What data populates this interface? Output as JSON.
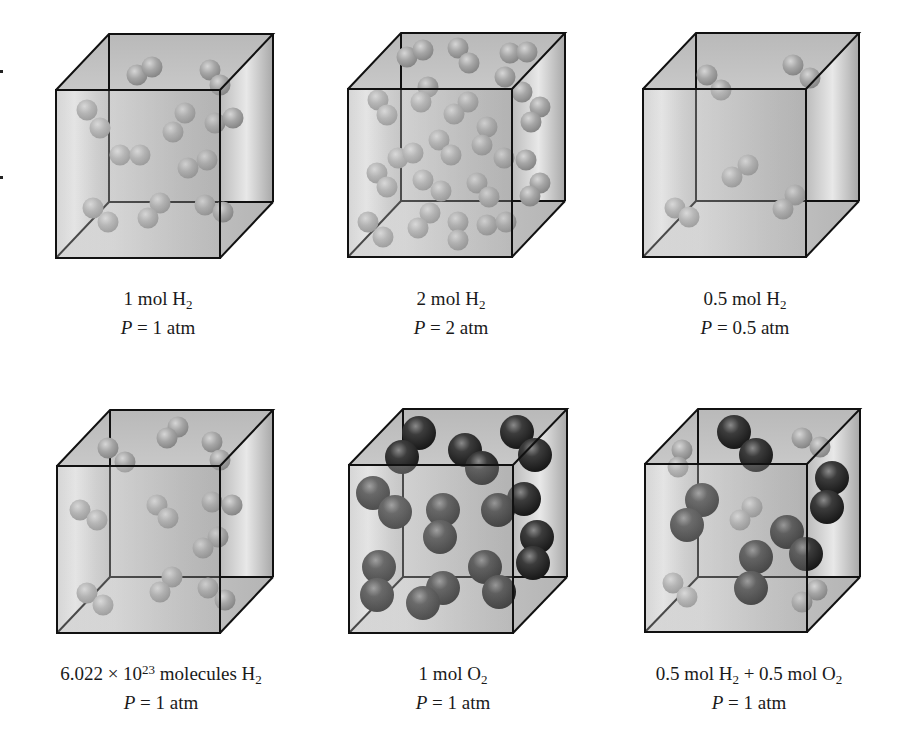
{
  "figure": {
    "colors": {
      "h2_molecule": "#a9a9a9",
      "o2_molecule": "#2e2e2e",
      "cube_edge": "#111111",
      "cube_face_light": "#e4e4e4",
      "cube_face_dark": "#b4b4b4"
    },
    "panels": [
      {
        "id": "p1",
        "label_parts": {
          "amount": "1 mol H",
          "sub": "2",
          "pressure_var": "P",
          "pressure_rest": " = 1 atm"
        },
        "cube": {
          "fx": 56,
          "fy": 90,
          "fw": 164,
          "fh": 168,
          "dx": 53,
          "dy": -56
        },
        "label_pos": {
          "cx": 158,
          "top": 282
        },
        "molecules": [
          {
            "t": "h",
            "p": [
              [
                137,
                75
              ],
              [
                152,
                67
              ]
            ]
          },
          {
            "t": "h",
            "p": [
              [
                210,
                70
              ],
              [
                220,
                85
              ]
            ]
          },
          {
            "t": "h",
            "p": [
              [
                87,
                110
              ],
              [
                100,
                128
              ]
            ]
          },
          {
            "t": "h",
            "p": [
              [
                185,
                113
              ],
              [
                173,
                132
              ]
            ]
          },
          {
            "t": "h",
            "p": [
              [
                215,
                123
              ],
              [
                233,
                118
              ]
            ]
          },
          {
            "t": "h",
            "p": [
              [
                120,
                155
              ],
              [
                140,
                155
              ]
            ]
          },
          {
            "t": "h",
            "p": [
              [
                207,
                160
              ],
              [
                188,
                168
              ]
            ]
          },
          {
            "t": "h",
            "p": [
              [
                93,
                208
              ],
              [
                108,
                222
              ]
            ]
          },
          {
            "t": "h",
            "p": [
              [
                160,
                203
              ],
              [
                148,
                218
              ]
            ]
          },
          {
            "t": "h",
            "p": [
              [
                205,
                205
              ],
              [
                223,
                212
              ]
            ]
          }
        ]
      },
      {
        "id": "p2",
        "label_parts": {
          "amount": "2 mol H",
          "sub": "2",
          "pressure_var": "P",
          "pressure_rest": " = 2 atm"
        },
        "cube": {
          "fx": 348,
          "fy": 89,
          "fw": 164,
          "fh": 168,
          "dx": 53,
          "dy": -56
        },
        "label_pos": {
          "cx": 451,
          "top": 282
        },
        "molecules": [
          {
            "t": "h",
            "p": [
              [
                407,
                57
              ],
              [
                423,
                50
              ]
            ]
          },
          {
            "t": "h",
            "p": [
              [
                458,
                48
              ],
              [
                469,
                63
              ]
            ]
          },
          {
            "t": "h",
            "p": [
              [
                510,
                53
              ],
              [
                527,
                52
              ]
            ]
          },
          {
            "t": "h",
            "p": [
              [
                505,
                77
              ],
              [
                522,
                92
              ]
            ]
          },
          {
            "t": "h",
            "p": [
              [
                428,
                87
              ],
              [
                421,
                102
              ]
            ]
          },
          {
            "t": "h",
            "p": [
              [
                378,
                100
              ],
              [
                387,
                115
              ]
            ]
          },
          {
            "t": "h",
            "p": [
              [
                468,
                102
              ],
              [
                454,
                114
              ]
            ]
          },
          {
            "t": "h",
            "p": [
              [
                540,
                107
              ],
              [
                531,
                122
              ]
            ]
          },
          {
            "t": "h",
            "p": [
              [
                487,
                127
              ],
              [
                482,
                145
              ]
            ]
          },
          {
            "t": "h",
            "p": [
              [
                439,
                140
              ],
              [
                451,
                155
              ]
            ]
          },
          {
            "t": "h",
            "p": [
              [
                398,
                158
              ],
              [
                413,
                153
              ]
            ]
          },
          {
            "t": "h",
            "p": [
              [
                504,
                158
              ],
              [
                526,
                160
              ]
            ]
          },
          {
            "t": "h",
            "p": [
              [
                377,
                173
              ],
              [
                387,
                187
              ]
            ]
          },
          {
            "t": "h",
            "p": [
              [
                423,
                180
              ],
              [
                441,
                191
              ]
            ]
          },
          {
            "t": "h",
            "p": [
              [
                477,
                183
              ],
              [
                489,
                197
              ]
            ]
          },
          {
            "t": "h",
            "p": [
              [
                540,
                183
              ],
              [
                530,
                196
              ]
            ]
          },
          {
            "t": "h",
            "p": [
              [
                368,
                222
              ],
              [
                383,
                237
              ]
            ]
          },
          {
            "t": "h",
            "p": [
              [
                430,
                213
              ],
              [
                418,
                228
              ]
            ]
          },
          {
            "t": "h",
            "p": [
              [
                458,
                222
              ],
              [
                458,
                240
              ]
            ]
          },
          {
            "t": "h",
            "p": [
              [
                487,
                225
              ],
              [
                506,
                222
              ]
            ]
          }
        ]
      },
      {
        "id": "p3",
        "label_parts": {
          "amount": "0.5 mol H",
          "sub": "2",
          "pressure_var": "P",
          "pressure_rest": " = 0.5 atm"
        },
        "cube": {
          "fx": 643,
          "fy": 89,
          "fw": 163,
          "fh": 168,
          "dx": 53,
          "dy": -56
        },
        "label_pos": {
          "cx": 745,
          "top": 282
        },
        "molecules": [
          {
            "t": "h",
            "p": [
              [
                707,
                75
              ],
              [
                721,
                90
              ]
            ]
          },
          {
            "t": "h",
            "p": [
              [
                793,
                65
              ],
              [
                810,
                78
              ]
            ]
          },
          {
            "t": "h",
            "p": [
              [
                748,
                165
              ],
              [
                732,
                177
              ]
            ]
          },
          {
            "t": "h",
            "p": [
              [
                675,
                208
              ],
              [
                689,
                217
              ]
            ]
          },
          {
            "t": "h",
            "p": [
              [
                795,
                195
              ],
              [
                783,
                209
              ]
            ]
          }
        ]
      },
      {
        "id": "p4",
        "label_parts": {
          "amount": "6.022 × 10",
          "sup": "23",
          "amount_rest": " molecules H",
          "sub": "2",
          "pressure_var": "P",
          "pressure_rest": " = 1 atm"
        },
        "cube": {
          "fx": 57,
          "fy": 466,
          "fw": 163,
          "fh": 167,
          "dx": 53,
          "dy": -56
        },
        "label_pos": {
          "cx": 161,
          "top": 657
        },
        "molecules": [
          {
            "t": "h",
            "p": [
              [
                108,
                448
              ],
              [
                125,
                462
              ]
            ]
          },
          {
            "t": "h",
            "p": [
              [
                178,
                427
              ],
              [
                167,
                438
              ]
            ]
          },
          {
            "t": "h",
            "p": [
              [
                212,
                442
              ],
              [
                220,
                460
              ]
            ]
          },
          {
            "t": "h",
            "p": [
              [
                80,
                510
              ],
              [
                97,
                520
              ]
            ]
          },
          {
            "t": "h",
            "p": [
              [
                157,
                505
              ],
              [
                168,
                518
              ]
            ]
          },
          {
            "t": "h",
            "p": [
              [
                212,
                502
              ],
              [
                232,
                505
              ]
            ]
          },
          {
            "t": "h",
            "p": [
              [
                218,
                537
              ],
              [
                203,
                548
              ]
            ]
          },
          {
            "t": "h",
            "p": [
              [
                87,
                593
              ],
              [
                103,
                605
              ]
            ]
          },
          {
            "t": "h",
            "p": [
              [
                172,
                577
              ],
              [
                160,
                592
              ]
            ]
          },
          {
            "t": "h",
            "p": [
              [
                208,
                588
              ],
              [
                225,
                600
              ]
            ]
          }
        ]
      },
      {
        "id": "p5",
        "label_parts": {
          "amount": "1 mol O",
          "sub": "2",
          "pressure_var": "P",
          "pressure_rest": " = 1 atm"
        },
        "cube": {
          "fx": 349,
          "fy": 465,
          "fw": 164,
          "fh": 168,
          "dx": 54,
          "dy": -56
        },
        "label_pos": {
          "cx": 453,
          "top": 657
        },
        "molecules": [
          {
            "t": "o",
            "p": [
              [
                419,
                433
              ],
              [
                402,
                457
              ]
            ]
          },
          {
            "t": "o",
            "p": [
              [
                465,
                450
              ],
              [
                482,
                468
              ]
            ]
          },
          {
            "t": "o",
            "p": [
              [
                517,
                432
              ],
              [
                535,
                455
              ]
            ]
          },
          {
            "t": "o",
            "p": [
              [
                373,
                493
              ],
              [
                395,
                512
              ]
            ]
          },
          {
            "t": "o",
            "p": [
              [
                443,
                510
              ],
              [
                440,
                537
              ]
            ]
          },
          {
            "t": "o",
            "p": [
              [
                524,
                499
              ],
              [
                498,
                510
              ]
            ]
          },
          {
            "t": "o",
            "p": [
              [
                537,
                537
              ],
              [
                533,
                563
              ]
            ]
          },
          {
            "t": "o",
            "p": [
              [
                379,
                567
              ],
              [
                377,
                595
              ]
            ]
          },
          {
            "t": "o",
            "p": [
              [
                485,
                567
              ],
              [
                499,
                592
              ]
            ]
          },
          {
            "t": "o",
            "p": [
              [
                443,
                588
              ],
              [
                423,
                603
              ]
            ]
          }
        ]
      },
      {
        "id": "p6",
        "label_parts": {
          "amount": "0.5 mol H",
          "sub": "2",
          "amount_rest": " + 0.5 mol O",
          "sub2": "2",
          "pressure_var": "P",
          "pressure_rest": " = 1 atm"
        },
        "cube": {
          "fx": 645,
          "fy": 464,
          "fw": 162,
          "fh": 168,
          "dx": 53,
          "dy": -55
        },
        "label_pos": {
          "cx": 749,
          "top": 657
        },
        "molecules": [
          {
            "t": "h",
            "p": [
              [
                682,
                450
              ],
              [
                678,
                467
              ]
            ]
          },
          {
            "t": "h",
            "p": [
              [
                802,
                438
              ],
              [
                820,
                447
              ]
            ]
          },
          {
            "t": "h",
            "p": [
              [
                752,
                507
              ],
              [
                740,
                520
              ]
            ]
          },
          {
            "t": "h",
            "p": [
              [
                673,
                583
              ],
              [
                687,
                597
              ]
            ]
          },
          {
            "t": "h",
            "p": [
              [
                817,
                590
              ],
              [
                802,
                602
              ]
            ]
          },
          {
            "t": "o",
            "p": [
              [
                734,
                432
              ],
              [
                756,
                455
              ]
            ]
          },
          {
            "t": "o",
            "p": [
              [
                832,
                478
              ],
              [
                827,
                507
              ]
            ]
          },
          {
            "t": "o",
            "p": [
              [
                702,
                500
              ],
              [
                687,
                525
              ]
            ]
          },
          {
            "t": "o",
            "p": [
              [
                787,
                532
              ],
              [
                806,
                554
              ]
            ]
          },
          {
            "t": "o",
            "p": [
              [
                756,
                557
              ],
              [
                751,
                588
              ]
            ]
          }
        ]
      }
    ]
  },
  "labels": {
    "p1": {
      "line1_a": "1 mol H",
      "line1_sub": "2",
      "line2_var": "P",
      "line2_rest": " = 1 atm"
    },
    "p2": {
      "line1_a": "2 mol H",
      "line1_sub": "2",
      "line2_var": "P",
      "line2_rest": " = 2 atm"
    },
    "p3": {
      "line1_a": "0.5 mol H",
      "line1_sub": "2",
      "line2_var": "P",
      "line2_rest": " = 0.5 atm"
    },
    "p4": {
      "line1_a": "6.022 × 10",
      "line1_sup": "23",
      "line1_b": " molecules H",
      "line1_sub": "2",
      "line2_var": "P",
      "line2_rest": " = 1 atm"
    },
    "p5": {
      "line1_a": "1 mol O",
      "line1_sub": "2",
      "line2_var": "P",
      "line2_rest": " = 1 atm"
    },
    "p6": {
      "line1_a": "0.5 mol H",
      "line1_sub": "2",
      "line1_b": " + 0.5 mol O",
      "line1_sub2": "2",
      "line2_var": "P",
      "line2_rest": " = 1 atm"
    }
  }
}
